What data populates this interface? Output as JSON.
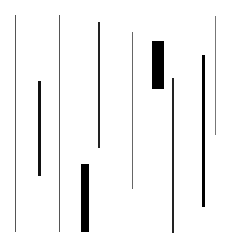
{
  "canvas": {
    "width": 232,
    "height": 243,
    "background": "#ffffff"
  },
  "bars": [
    {
      "id": "bar-1",
      "x": 15,
      "y": 15,
      "width": 1,
      "height": 217,
      "color": "#555555"
    },
    {
      "id": "bar-2",
      "x": 38,
      "y": 81,
      "width": 3,
      "height": 95,
      "color": "#111111"
    },
    {
      "id": "bar-3",
      "x": 59,
      "y": 15,
      "width": 1,
      "height": 217,
      "color": "#555555"
    },
    {
      "id": "bar-4",
      "x": 81,
      "y": 164,
      "width": 8,
      "height": 68,
      "color": "#000000"
    },
    {
      "id": "bar-5",
      "x": 98,
      "y": 22,
      "width": 2,
      "height": 126,
      "color": "#222222"
    },
    {
      "id": "bar-6",
      "x": 132,
      "y": 32,
      "width": 1,
      "height": 157,
      "color": "#666666"
    },
    {
      "id": "bar-7",
      "x": 152,
      "y": 41,
      "width": 12,
      "height": 48,
      "color": "#000000"
    },
    {
      "id": "bar-8",
      "x": 172,
      "y": 78,
      "width": 2,
      "height": 155,
      "color": "#222222"
    },
    {
      "id": "bar-9",
      "x": 202,
      "y": 55,
      "width": 3,
      "height": 152,
      "color": "#000000"
    },
    {
      "id": "bar-10",
      "x": 215,
      "y": 16,
      "width": 1,
      "height": 119,
      "color": "#777777"
    }
  ]
}
